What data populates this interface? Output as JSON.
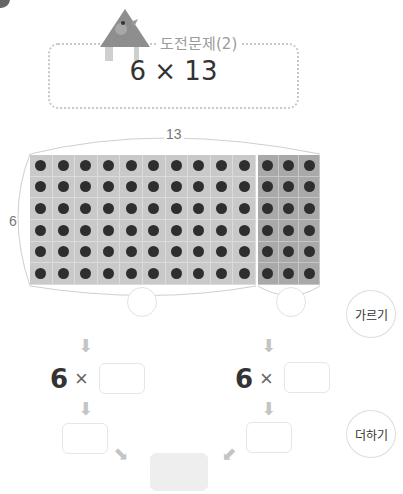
{
  "header": {
    "title": "도전문제(2)",
    "expression": "6 × 13"
  },
  "array_model": {
    "rows": 6,
    "columns": 13,
    "split_left_columns": 10,
    "split_right_columns": 3,
    "width_label": "13",
    "height_label": "6",
    "colors": {
      "left_fill": "#c9c9c9",
      "right_fill": "#a9a9a9",
      "dot": "#2e2e2e"
    }
  },
  "steps": {
    "split_label": "가르기",
    "add_label": "더하기",
    "left_multiplier": "6",
    "right_multiplier": "6",
    "times_sign": "×",
    "left_split_value": "",
    "right_split_value": "",
    "left_factor_value": "",
    "right_factor_value": "",
    "left_product_value": "",
    "right_product_value": "",
    "total_value": ""
  }
}
